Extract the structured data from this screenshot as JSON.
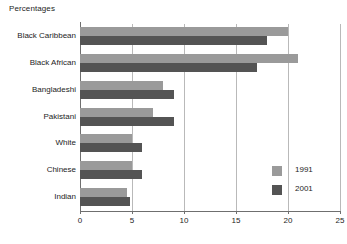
{
  "chart_data": {
    "type": "bar",
    "orientation": "horizontal",
    "title": "Percentages",
    "xlabel": "",
    "ylabel": "",
    "categories": [
      "Black Caribbean",
      "Black African",
      "Bangladeshi",
      "Pakistani",
      "White",
      "Chinese",
      "Indian"
    ],
    "series": [
      {
        "name": "1991",
        "color": "#9a9a9a",
        "values": [
          20,
          21,
          8,
          7,
          5,
          5,
          4.5
        ]
      },
      {
        "name": "2001",
        "color": "#545454",
        "values": [
          18,
          17,
          9,
          9,
          6,
          6,
          4.8
        ]
      }
    ],
    "xlim": [
      0,
      25
    ],
    "xticks": [
      0,
      5,
      10,
      15,
      20,
      25
    ],
    "xtick_labels": [
      "0",
      "5",
      "10",
      "15",
      "20",
      "25"
    ],
    "grid": "vertical",
    "legend_position": "inside-bottom-right"
  },
  "colors": {
    "series_1991": "#9a9a9a",
    "series_2001": "#545454",
    "axis": "#6f6f6f",
    "gridline": "#b9b9b9",
    "text": "#1d1d1d",
    "background": "#ffffff"
  }
}
